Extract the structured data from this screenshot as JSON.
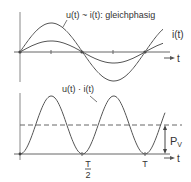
{
  "top_graph": {
    "label_u": "u(t) ~ i(t): gleichphasig",
    "label_i": "i(t)",
    "axis_label": "t",
    "u_amplitude": 1.0,
    "i_amplitude": 0.38,
    "periods_shown": 1.15
  },
  "bottom_graph": {
    "label_p": "u(t) · i(t)",
    "axis_label": "t",
    "tick_half": {
      "num": "T",
      "den": "2"
    },
    "tick_full": "T",
    "mean_label": "P",
    "mean_label_sub": "V",
    "mean_fraction_of_peak": 0.5
  },
  "colors": {
    "line": "#555555",
    "axis": "#666666",
    "text": "#333333"
  }
}
